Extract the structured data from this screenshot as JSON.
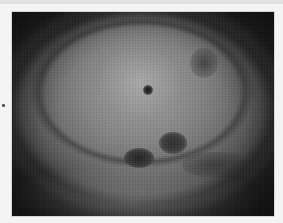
{
  "image": {
    "description": "Grayscale endoscopic view of mucosal tissue with concentric folds and several dark lesions",
    "colorspace": "grayscale",
    "features": [
      {
        "name": "central-bright-dome",
        "kind": "highlight"
      },
      {
        "name": "small-dark-puncta",
        "kind": "lesion"
      },
      {
        "name": "dark-lesion-right",
        "kind": "lesion"
      },
      {
        "name": "dark-lesion-left",
        "kind": "lesion"
      },
      {
        "name": "upper-right-shadow",
        "kind": "shadow"
      },
      {
        "name": "lower-right-dark-fold",
        "kind": "shadow"
      }
    ],
    "colors": {
      "frame_border": "#f4f4f4",
      "tissue_mid": "#8c8c8c",
      "tissue_dark": "#1e1e1e",
      "lesion": "#222222"
    }
  }
}
